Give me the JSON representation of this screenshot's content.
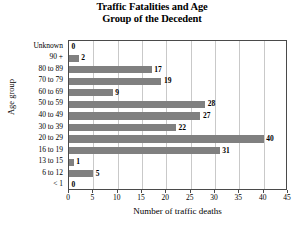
{
  "chart_data": {
    "type": "bar",
    "orientation": "horizontal",
    "title": "Traffic Fatalities and Age Group of the Decedent",
    "title_lines": [
      "Traffic Fatalities and Age",
      "Group of the Decedent"
    ],
    "xlabel": "Number of traffic deaths",
    "ylabel": "Age group",
    "categories": [
      "Unknown",
      "90 +",
      "80 to 89",
      "70 to 79",
      "60 to 69",
      "50 to 59",
      "40 to 49",
      "30 to 39",
      "20 to 29",
      "16 to 19",
      "13 to 15",
      "6 to 12",
      "< 1"
    ],
    "values": [
      0,
      2,
      17,
      19,
      9,
      28,
      27,
      22,
      40,
      31,
      1,
      5,
      0
    ],
    "value_labels": [
      "0",
      "2",
      "17",
      "19",
      "9",
      "28",
      "27",
      "22",
      "40",
      "31",
      "1",
      "5",
      "0"
    ],
    "xlim": [
      0,
      45
    ],
    "xticks": [
      0,
      5,
      10,
      15,
      20,
      25,
      30,
      35,
      40,
      45
    ],
    "xtick_labels": [
      "0",
      "5",
      "10",
      "15",
      "20",
      "25",
      "30",
      "35",
      "40",
      "45"
    ],
    "grid": "vertical",
    "legend": "none",
    "bar_color": "#808080",
    "grid_color": "#c9c9c9",
    "axis_color": "#4a4a4a",
    "background": "#ffffff"
  }
}
